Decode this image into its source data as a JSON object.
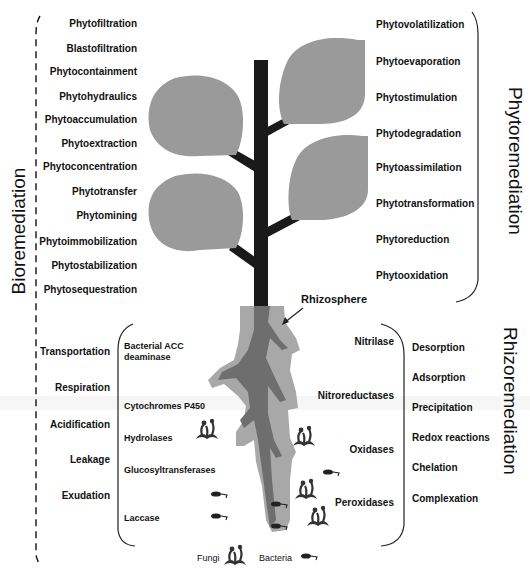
{
  "titles": {
    "bioremediation": "Bioremediation",
    "phytoremediation": "Phytoremediation",
    "rhizoremediation": "Rhizoremediation",
    "rhizosphere": "Rhizosphere"
  },
  "left_phyto_processes": [
    "Phytofiltration",
    "Blastofiltration",
    "Phytocontainment",
    "Phytohydraulics",
    "Phytoaccumulation",
    "Phytoextraction",
    "Phytoconcentration",
    "Phytotransfer",
    "Phytomining",
    "Phytoimmobilization",
    "Phytostabilization",
    "Phytosequestration"
  ],
  "right_phyto_processes": [
    "Phytovolatilization",
    "Phytoevaporation",
    "Phytostimulation",
    "Phytodegradation",
    "Phytoassimilation",
    "Phytotransformation",
    "Phytoreduction",
    "Phytooxidation"
  ],
  "root_processes_left": [
    "Transportation",
    "Respiration",
    "Acidification",
    "Leakage",
    "Exudation"
  ],
  "enzymes_left": [
    "Bacterial ACC deaminase",
    "Cytochromes P450",
    "Hydrolases",
    "Glucosyltransferases",
    "Laccase"
  ],
  "enzymes_right": [
    "Nitrilase",
    "Nitroreductases",
    "Oxidases",
    "Peroxidases"
  ],
  "rhizo_processes_right": [
    "Desorption",
    "Adsorption",
    "Precipitation",
    "Redox reactions",
    "Chelation",
    "Complexation"
  ],
  "legend": {
    "fungi": "Fungi",
    "bacteria": "Bacteria"
  },
  "colors": {
    "stem": "#1a1a1a",
    "leaf": "#9a9a9a",
    "root_outer": "#a8a8a8",
    "root_inner": "#6e6e6e",
    "text": "#111111"
  }
}
